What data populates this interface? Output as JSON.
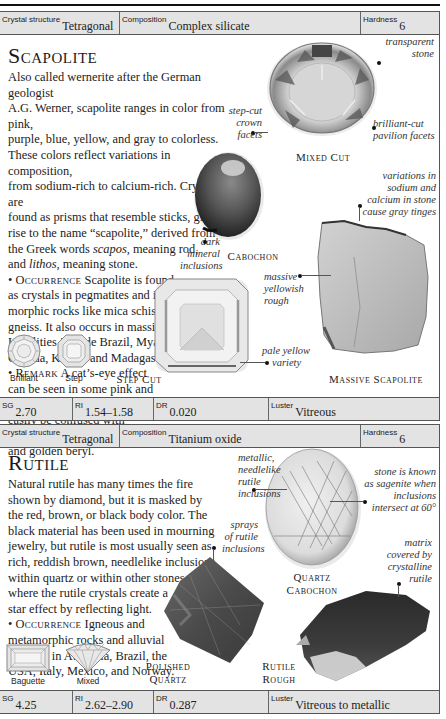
{
  "sections": [
    {
      "name": "Scapolite",
      "title": "Scapolite",
      "properties_top": {
        "crystal_structure": {
          "label": "Crystal structure",
          "value": "Tetragonal"
        },
        "composition": {
          "label": "Composition",
          "value": "Complex silicate"
        },
        "hardness": {
          "label": "Hardness",
          "value": "6"
        }
      },
      "description": [
        "Also called wernerite after the German geologist",
        "A.G. Werner, scapolite ranges in color from pink,",
        "purple, blue, yellow, and gray to colorless.",
        "These colors reflect variations in composition,",
        "from sodium-rich to calcium-rich. Crystals are",
        "found as prisms that resemble sticks, giving",
        "rise to the name “scapolite,” derived from",
        "the Greek words",
        "scapos,",
        "meaning rod,",
        "and",
        "lithos,",
        "meaning stone."
      ],
      "occurrence": {
        "heading": "Occurrence",
        "lines": [
          "Scapolite is found",
          "as crystals in pegmatites and in meta-",
          "morphic rocks like mica schist and",
          "gneiss. It also occurs in massive form.",
          "Localities include Brazil, Myanmar,",
          "Canada, Kenya, and Madagascar."
        ]
      },
      "remark": {
        "heading": "Remark",
        "lines": [
          "A cat’s-eye effect",
          "can be seen in some pink and",
          "purple stones. Scapolite may",
          "easily be confused with",
          "amblygonite, chrysoberyl,",
          "and golden beryl."
        ]
      },
      "cuts": [
        {
          "label": "Brilliant",
          "icon": "brilliant-cut-icon"
        },
        {
          "label": "Step",
          "icon": "step-cut-icon"
        }
      ],
      "specimens": [
        {
          "caption": "Mixed Cut"
        },
        {
          "caption": "Cabochon"
        },
        {
          "caption": "Step Cut"
        },
        {
          "caption": "Massive Scapolite"
        }
      ],
      "annotations": {
        "transparent": [
          "transparent",
          "stone"
        ],
        "step_cut_crown": [
          "step-cut",
          "crown",
          "facets"
        ],
        "brilliant_pavilion": [
          "brilliant-cut",
          "pavilion facets"
        ],
        "variations": [
          "variations in",
          "sodium and",
          "calcium in stone",
          "cause gray tinges"
        ],
        "dark_inclusions": [
          "dark",
          "mineral",
          "inclusions"
        ],
        "massive_rough": [
          "massive",
          "yellowish",
          "rough"
        ],
        "pale_yellow": [
          "pale yellow",
          "variety"
        ]
      },
      "properties_bottom": {
        "sg": {
          "label": "SG",
          "value": "2.70"
        },
        "ri": {
          "label": "RI",
          "value": "1.54–1.58"
        },
        "dr": {
          "label": "DR",
          "value": "0.020"
        },
        "luster": {
          "label": "Luster",
          "value": "Vitreous"
        }
      }
    },
    {
      "name": "Rutile",
      "title": "Rutile",
      "properties_top": {
        "crystal_structure": {
          "label": "Crystal structure",
          "value": "Tetragonal"
        },
        "composition": {
          "label": "Composition",
          "value": "Titanium oxide"
        },
        "hardness": {
          "label": "Hardness",
          "value": "6"
        }
      },
      "description": [
        "Natural rutile has many times the fire",
        "shown by diamond, but it is masked by",
        "the red, brown, or black body color. The",
        "black material has been used in mourning",
        "jewelry, but rutile is most usually seen as",
        "rich, reddish brown, needlelike inclusions",
        "within quartz or within other stones,",
        "where the rutile crystals create a",
        "star effect by reflecting light."
      ],
      "occurrence": {
        "heading": "Occurrence",
        "lines": [
          "Igneous and",
          "metamorphic rocks and alluvial",
          "deposits in Australia, Brazil, the",
          "USA, Italy, Mexico, and Norway."
        ]
      },
      "cuts": [
        {
          "label": "Baguette",
          "icon": "baguette-cut-icon"
        },
        {
          "label": "Mixed",
          "icon": "mixed-cut-icon"
        }
      ],
      "specimens": [
        {
          "caption_lines": [
            "Quartz",
            "Cabochon"
          ]
        },
        {
          "caption_lines": [
            "Polished",
            "Quartz"
          ]
        },
        {
          "caption_lines": [
            "Rutile",
            "Rough"
          ]
        }
      ],
      "annotations": {
        "metallic": [
          "metallic,",
          "needlelike",
          "rutile",
          "inclusions"
        ],
        "sagenite": [
          "stone is known",
          "as sagenite when",
          "inclusions",
          "intersect at 60°"
        ],
        "sprays": [
          "sprays",
          "of rutile",
          "inclusions"
        ],
        "matrix": [
          "matrix",
          "covered by",
          "crystalline",
          "rutile"
        ]
      },
      "properties_bottom": {
        "sg": {
          "label": "SG",
          "value": "4.25"
        },
        "ri": {
          "label": "RI",
          "value": "2.62–2.90"
        },
        "dr": {
          "label": "DR",
          "value": "0.287"
        },
        "luster": {
          "label": "Luster",
          "value": "Vitreous to metallic"
        }
      }
    }
  ]
}
